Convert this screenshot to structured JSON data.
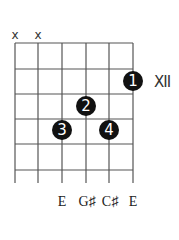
{
  "chord": {
    "position_label": "XII",
    "muted_markers": [
      {
        "string": 1,
        "symbol": "x"
      },
      {
        "string": 2,
        "symbol": "x"
      }
    ],
    "fingers": [
      {
        "finger": "1",
        "string": 6,
        "fret": 1
      },
      {
        "finger": "2",
        "string": 4,
        "fret": 2
      },
      {
        "finger": "3",
        "string": 3,
        "fret": 3
      },
      {
        "finger": "4",
        "string": 5,
        "fret": 3
      }
    ],
    "note_labels": [
      {
        "string": 3,
        "text": "E"
      },
      {
        "string": 4,
        "text": "G♯"
      },
      {
        "string": 5,
        "text": "C♯"
      },
      {
        "string": 6,
        "text": "E"
      }
    ]
  },
  "colors": {
    "grid": "#555555",
    "dot": "#111111",
    "dot_text": "#ffffff"
  }
}
